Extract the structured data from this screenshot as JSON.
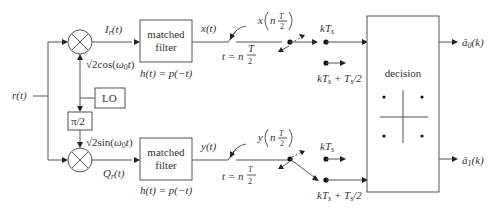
{
  "diagram": {
    "title": "",
    "input_label": "r(t)",
    "top_branch": {
      "mixer_output_label": "I_r(t)",
      "carrier_label": "√2cos(ω0t)",
      "filter_label_line1": "matched",
      "filter_label_line2": "filter",
      "impulse_response": "h(t) = p(−t)",
      "filter_output_label": "x(t)",
      "sampler_time_label": "t = n Ts/2",
      "sample_label": "x(n Ts/2)",
      "switch_pos_1": "kTs",
      "switch_pos_2": "kTs + Ts/2",
      "output_label": "â0(k)"
    },
    "bottom_branch": {
      "mixer_output_label": "Q_r(t)",
      "carrier_label": "√2sin(ω0t)",
      "filter_label_line1": "matched",
      "filter_label_line2": "filter",
      "impulse_response": "h(t) = p(−t)",
      "filter_output_label": "y(t)",
      "sampler_time_label": "t = n Ts/2",
      "sample_label": "y(n Ts/2)",
      "switch_pos_1": "kTs",
      "switch_pos_2": "kTs + Ts/2",
      "output_label": "â1(k)"
    },
    "oscillator_label": "LO",
    "phase_shift_label": "π/2",
    "decision_label": "decision",
    "colors": {
      "line": "#555555",
      "text": "#333333",
      "background": "#ffffff"
    }
  }
}
